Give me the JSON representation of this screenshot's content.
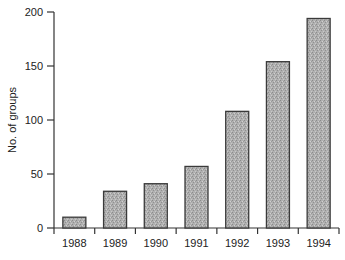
{
  "chart_data": {
    "type": "bar",
    "title": "",
    "xlabel": "",
    "ylabel": "No. of groups",
    "categories": [
      "1988",
      "1989",
      "1990",
      "1991",
      "1992",
      "1993",
      "1994"
    ],
    "values": [
      10,
      34,
      41,
      57,
      108,
      154,
      194
    ],
    "ylim": [
      0,
      200
    ],
    "yticks": [
      0,
      50,
      100,
      150,
      200
    ],
    "grid": false,
    "legend": null,
    "bar_fill": "#a9a9a9",
    "bar_stroke": "#3a3a3a"
  }
}
